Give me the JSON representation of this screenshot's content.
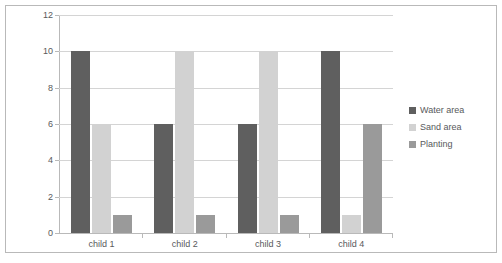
{
  "chart_data": {
    "type": "bar",
    "title": "",
    "xlabel": "",
    "ylabel": "",
    "categories": [
      "child 1",
      "child 2",
      "child 3",
      "child 4"
    ],
    "series": [
      {
        "name": "Water area",
        "color": "#5f5f5f",
        "values": [
          10,
          6,
          6,
          10
        ]
      },
      {
        "name": "Sand area",
        "color": "#d2d2d2",
        "values": [
          6,
          10,
          10,
          1
        ]
      },
      {
        "name": "Planting",
        "color": "#9a9a9a",
        "values": [
          1,
          1,
          1,
          6
        ]
      }
    ],
    "ylim": [
      0,
      12
    ],
    "yticks": [
      0,
      2,
      4,
      6,
      8,
      10,
      12
    ],
    "ytick_labels": [
      "0",
      "2",
      "4",
      "6",
      "8",
      "10",
      "12"
    ],
    "grid": true,
    "legend_position": "right"
  },
  "colors": {
    "frame_border": "#b9b9b9",
    "gridline": "#d4d4d4",
    "axis": "#b9b9b9",
    "text": "#58595b",
    "background": "#ffffff"
  }
}
